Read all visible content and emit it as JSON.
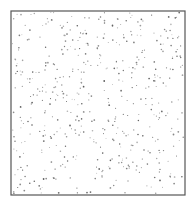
{
  "chart_data": {
    "type": "scatter",
    "title": "",
    "xlabel": "",
    "ylabel": "",
    "grid": false,
    "legend": null,
    "frame": {
      "x": 11,
      "y": 11,
      "width": 174,
      "height": 184,
      "stroke": "#555555"
    },
    "point_color": "#7a7a7a",
    "point_count_estimate": 500,
    "seed": 7,
    "note": "Uniform random scatter of ~500 small gray points inside a square frame; no axes, ticks, or labels."
  }
}
